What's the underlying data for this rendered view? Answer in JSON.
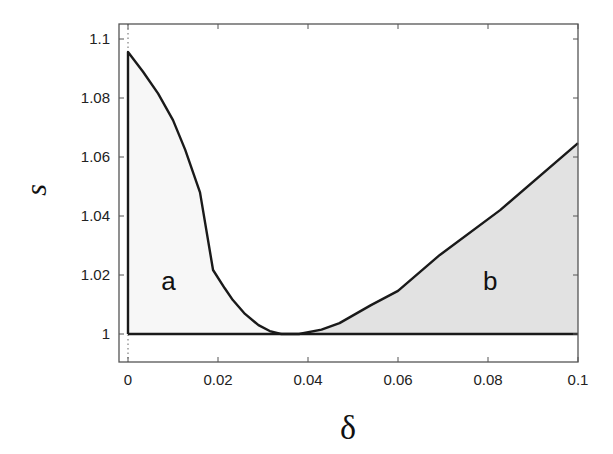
{
  "chart_data": {
    "type": "line",
    "title": "",
    "xlabel": "δ",
    "ylabel": "s",
    "xlim": [
      -0.002,
      0.1
    ],
    "ylim": [
      0.9905,
      1.105
    ],
    "grid": false,
    "legend": null,
    "x_ticks": [
      0,
      0.02,
      0.04,
      0.06,
      0.08,
      0.1
    ],
    "x_tick_labels": [
      "0",
      "0.02",
      "0.04",
      "0.06",
      "0.08",
      "0.1"
    ],
    "y_ticks": [
      1,
      1.02,
      1.04,
      1.06,
      1.08,
      1.1
    ],
    "y_tick_labels": [
      "1",
      "1.02",
      "1.04",
      "1.06",
      "1.08",
      "1.1"
    ],
    "annotations": [
      {
        "text": "a",
        "x": 0.009,
        "y": 1.018
      },
      {
        "text": "b",
        "x": 0.0805,
        "y": 1.018
      }
    ],
    "series": [
      {
        "name": "boundary-left",
        "x": [
          0.0,
          0.0,
          0.0033,
          0.0067,
          0.01,
          0.0127,
          0.016,
          0.0189,
          0.0215,
          0.0233,
          0.026,
          0.029,
          0.0315,
          0.034
        ],
        "y": [
          1.0,
          1.0956,
          1.089,
          1.0815,
          1.0725,
          1.0625,
          1.048,
          1.0217,
          1.0155,
          1.0115,
          1.0068,
          1.003,
          1.001,
          1.0
        ]
      },
      {
        "name": "boundary-right",
        "x": [
          0.034,
          0.038,
          0.043,
          0.047,
          0.054,
          0.06,
          0.0693,
          0.0827,
          0.1
        ],
        "y": [
          1.0,
          1.0,
          1.0015,
          1.0037,
          1.0098,
          1.0146,
          1.0268,
          1.042,
          1.0647
        ]
      },
      {
        "name": "s-equals-1",
        "x": [
          0.0,
          0.1
        ],
        "y": [
          1.0,
          1.0
        ]
      },
      {
        "name": "delta-zero-dotted",
        "x": [
          0.0,
          0.0
        ],
        "y": [
          0.9905,
          1.105
        ]
      }
    ],
    "regions": [
      {
        "name": "a",
        "fill": "#f7f7f7",
        "description": "region bounded by δ=0, s=1 and left branch"
      },
      {
        "name": "b",
        "fill": "#e2e2e2",
        "description": "shaded region between s=1 and right branch"
      }
    ]
  },
  "colors": {
    "line": "#1a1a1a",
    "frame": "#555555",
    "region_a_fill": "#f7f7f7",
    "region_b_fill": "#e2e2e2"
  }
}
